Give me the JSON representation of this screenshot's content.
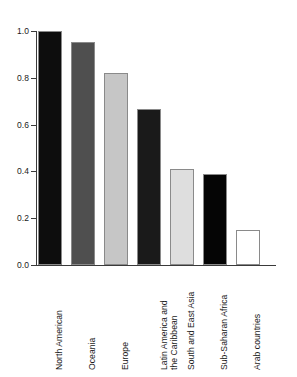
{
  "chart_data": {
    "type": "bar",
    "title": "",
    "subtitle": "",
    "xlabel": "",
    "ylabel": "",
    "ylim": [
      0.0,
      1.0
    ],
    "grid": false,
    "legend": "none",
    "orientation": "vertical",
    "y_ticks": [
      "0.0",
      "0.2",
      "0.4",
      "0.6",
      "0.8",
      "1.0"
    ],
    "y_tick_values": [
      0.0,
      0.2,
      0.4,
      0.6,
      0.8,
      1.0
    ],
    "categories": [
      "North American",
      "Oceania",
      "Europe",
      "Latin America and\nthe Caribbean",
      "South and East Asia",
      "Sub-Saharan Africa",
      "Arab countries"
    ],
    "values": [
      1.0,
      0.955,
      0.82,
      0.665,
      0.41,
      0.39,
      0.15
    ],
    "bar_colors": [
      "#0d0d0d",
      "#4f4f4f",
      "#c6c6c6",
      "#1a1a1a",
      "#dedede",
      "#050505",
      "#ffffff"
    ],
    "bar_border_color": "#8a8a8a",
    "axis_color": "#3a3a3a",
    "background": "#ffffff",
    "text_color": "#1a1a1a"
  }
}
